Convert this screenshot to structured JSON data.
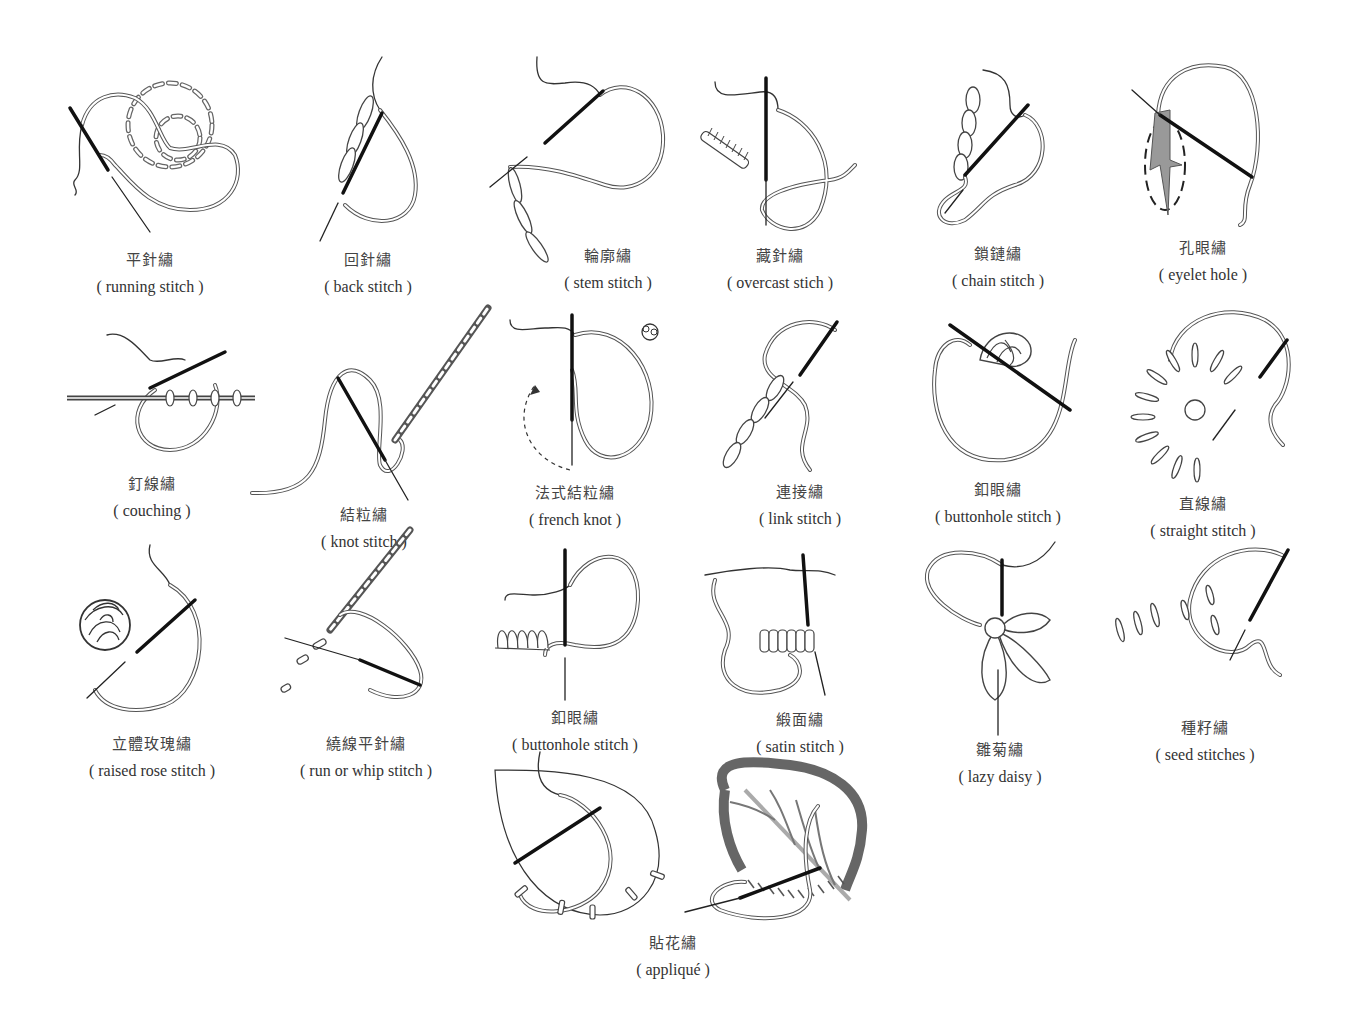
{
  "page": {
    "background": "#ffffff"
  },
  "stitches": [
    {
      "zh": "平針繡",
      "en": "( running stitch )",
      "icon": "running-stitch-illustration"
    },
    {
      "zh": "回針繡",
      "en": "( back stitch )",
      "icon": "back-stitch-illustration"
    },
    {
      "zh": "輪廓繡",
      "en": "( stem stitch )",
      "icon": "stem-stitch-illustration"
    },
    {
      "zh": "藏針繡",
      "en": "( overcast stich )",
      "icon": "overcast-stitch-illustration"
    },
    {
      "zh": "鎖鏈繡",
      "en": "( chain stitch )",
      "icon": "chain-stitch-illustration"
    },
    {
      "zh": "孔眼繡",
      "en": "( eyelet hole )",
      "icon": "eyelet-hole-illustration"
    },
    {
      "zh": "釘線繡",
      "en": "( couching )",
      "icon": "couching-illustration"
    },
    {
      "zh": "結粒繡",
      "en": "( knot stitch )",
      "icon": "knot-stitch-illustration"
    },
    {
      "zh": "法式結粒繡",
      "en": "( french knot )",
      "icon": "french-knot-illustration"
    },
    {
      "zh": "連接繡",
      "en": "( link stitch )",
      "icon": "link-stitch-illustration"
    },
    {
      "zh": "釦眼繡",
      "en": "( buttonhole stitch )",
      "icon": "buttonhole-stitch-illustration"
    },
    {
      "zh": "直線繡",
      "en": "( straight stitch )",
      "icon": "straight-stitch-illustration"
    },
    {
      "zh": "立體玫瑰繡",
      "en": "( raised rose stitch )",
      "icon": "raised-rose-stitch-illustration"
    },
    {
      "zh": "繞線平針繡",
      "en": "( run or whip stitch )",
      "icon": "whip-stitch-illustration"
    },
    {
      "zh": "釦眼繡",
      "en": "( buttonhole stitch )",
      "icon": "buttonhole-stitch-2-illustration"
    },
    {
      "zh": "緞面繡",
      "en": "( satin stitch )",
      "icon": "satin-stitch-illustration"
    },
    {
      "zh": "雛菊繡",
      "en": "( lazy daisy )",
      "icon": "lazy-daisy-illustration"
    },
    {
      "zh": "種籽繡",
      "en": "( seed stitches )",
      "icon": "seed-stitches-illustration"
    },
    {
      "zh": "貼花繡",
      "en": "( appliqué )",
      "icon": "applique-illustration"
    }
  ]
}
